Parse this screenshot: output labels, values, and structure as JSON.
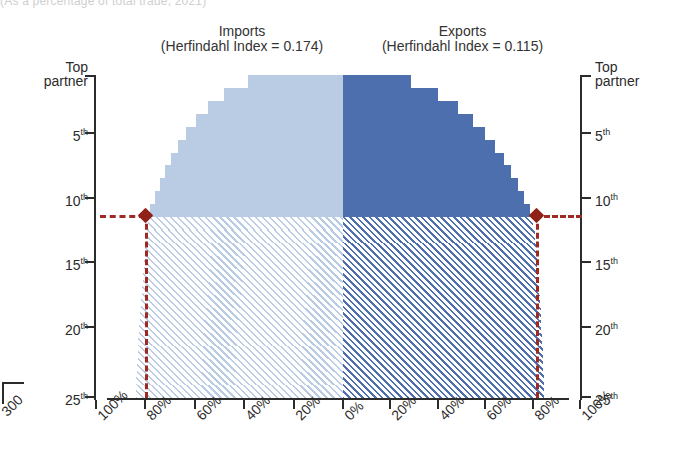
{
  "top_cut_text": "(As a percentage of total trade, 2021)",
  "panels": {
    "left": {
      "title": "Imports",
      "subtitle": "(Herfindahl Index = 0.174)",
      "color": "#b9cce4",
      "hatch_color": "#9fb6d6"
    },
    "right": {
      "title": "Exports",
      "subtitle": "(Herfindahl Index = 0.115)",
      "color": "#4d6fae",
      "hatch_color": "#4d6fae"
    }
  },
  "axes": {
    "y_labels": [
      "Top partner",
      "5th",
      "10th",
      "15th",
      "20th",
      "25th"
    ],
    "y_label_top_line1": "Top",
    "y_label_top_line2": "partner",
    "y_ticks_rank": [
      1,
      5,
      10,
      15,
      20,
      25
    ],
    "x_labels_left": [
      "100%",
      "80%",
      "60%",
      "40%",
      "20%",
      "0%"
    ],
    "x_labels_right": [
      "0%",
      "20%",
      "40%",
      "60%",
      "80%",
      "100%"
    ],
    "x_range_pct": [
      0,
      100
    ],
    "y_range_rank": [
      1,
      25
    ]
  },
  "reference": {
    "color": "#9e2a24",
    "rank": 11.3,
    "left_pct": 80,
    "right_pct": 81.5,
    "marker": "diamond-marker"
  },
  "neighbor_fragment": {
    "label": "300"
  },
  "chart_data": {
    "type": "area",
    "subtype": "butterfly-cumulative-concentration",
    "xlabel": "",
    "ylabel": "Partner rank",
    "xlim": [
      0,
      100
    ],
    "ylim": [
      1,
      25
    ],
    "grid": false,
    "legend": "none",
    "annotations": [
      "Imports (Herfindahl Index = 0.174)",
      "Exports (Herfindahl Index = 0.115)"
    ],
    "x_tick_labels_left": [
      "100%",
      "80%",
      "60%",
      "40%",
      "20%",
      "0%"
    ],
    "x_tick_labels_right": [
      "0%",
      "20%",
      "40%",
      "60%",
      "80%",
      "100%"
    ],
    "y_tick_labels": [
      "Top partner",
      "5th",
      "10th",
      "15th",
      "20th",
      "25th"
    ],
    "series": [
      {
        "name": "Imports",
        "side": "left",
        "color": "#b9cce4",
        "solid_through_rank": 11,
        "ranks": [
          1,
          2,
          3,
          4,
          5,
          6,
          7,
          8,
          9,
          10,
          11,
          12,
          13,
          14,
          15,
          16,
          17,
          18,
          19,
          20,
          21,
          22,
          23,
          24,
          25
        ],
        "cumulative_share_pct": [
          38.5,
          48.0,
          54.5,
          59.5,
          63.5,
          66.8,
          69.6,
          72.0,
          74.2,
          76.2,
          78.0,
          79.0,
          79.6,
          80.2,
          80.7,
          81.1,
          81.5,
          81.9,
          82.3,
          82.6,
          82.9,
          83.2,
          83.5,
          83.8,
          84.0
        ]
      },
      {
        "name": "Exports",
        "side": "right",
        "color": "#4d6fae",
        "solid_through_rank": 11,
        "ranks": [
          1,
          2,
          3,
          4,
          5,
          6,
          7,
          8,
          9,
          10,
          11,
          12,
          13,
          14,
          15,
          16,
          17,
          18,
          19,
          20,
          21,
          22,
          23,
          24,
          25
        ],
        "cumulative_share_pct": [
          28.5,
          40.0,
          48.5,
          55.0,
          60.0,
          64.2,
          67.8,
          71.0,
          73.8,
          76.4,
          78.8,
          80.0,
          80.8,
          81.4,
          81.9,
          82.4,
          82.8,
          83.1,
          83.4,
          83.7,
          84.0,
          84.3,
          84.5,
          84.7,
          84.9
        ]
      }
    ],
    "reference_line": {
      "rank": 11.3,
      "left_value_pct": 80,
      "right_value_pct": 81.5,
      "color": "#9e2a24",
      "style": "dashed"
    }
  }
}
